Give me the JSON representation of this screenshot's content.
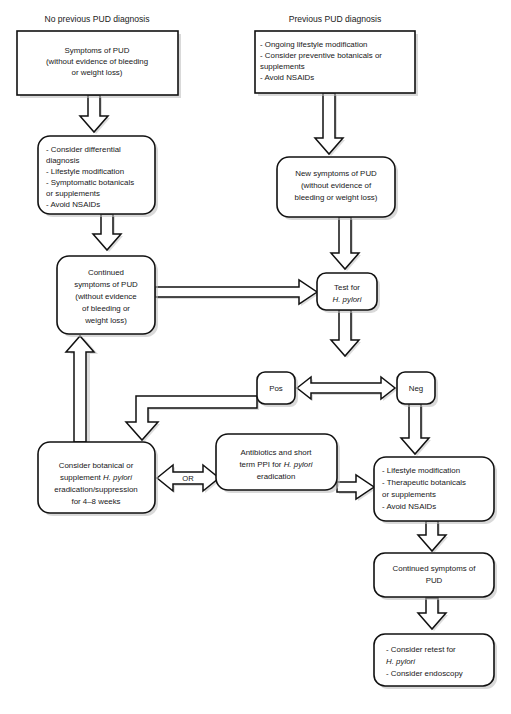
{
  "diagram": {
    "background_color": "#ffffff",
    "line_color": "#111111",
    "box_fill": "#ffffff",
    "text_color": "#181818",
    "columns": [
      {
        "id": "left-column",
        "label": "No previous PUD diagnosis"
      },
      {
        "id": "right-column",
        "label": "Previous PUD diagnosis"
      }
    ],
    "nodes": [
      {
        "id": "symptoms-of-pud",
        "shape": "rectangle",
        "align": "center",
        "lines": [
          "Symptoms of PUD",
          "(without evidence of bleeding",
          "or weight loss)"
        ]
      },
      {
        "id": "ongoing-lifestyle",
        "shape": "rectangle",
        "align": "left",
        "lines": [
          "- Ongoing lifestyle modification",
          "- Consider preventive botanicals or",
          "   supplements",
          "- Avoid NSAIDs"
        ]
      },
      {
        "id": "consider-differential",
        "shape": "rounded",
        "align": "left",
        "lines": [
          "- Consider differential",
          "   diagnosis",
          "- Lifestyle modification",
          "- Symptomatic botanicals",
          "   or supplements",
          "- Avoid NSAIDs"
        ]
      },
      {
        "id": "new-symptoms-of-pud",
        "shape": "rounded",
        "align": "center",
        "lines": [
          "New symptoms of PUD",
          "(without evidence of",
          "bleeding or weight loss)"
        ]
      },
      {
        "id": "continued-symptoms-of-pud",
        "shape": "rounded",
        "align": "center",
        "lines": [
          "Continued",
          "symptoms of PUD",
          "(without evidence",
          "of bleeding or",
          "weight loss)"
        ]
      },
      {
        "id": "test-for-h-pylori",
        "shape": "rounded",
        "align": "center",
        "lines": [
          "Test for",
          "H. pylori"
        ],
        "italic_lines": [
          1
        ]
      },
      {
        "id": "pos",
        "shape": "rounded",
        "align": "center",
        "lines": [
          "Pos"
        ]
      },
      {
        "id": "neg",
        "shape": "rounded",
        "align": "center",
        "lines": [
          "Neg"
        ]
      },
      {
        "id": "consider-botanical",
        "shape": "rounded",
        "align": "center",
        "lines": [
          "Consider botanical or",
          "supplement H. pylori",
          "eradication/suppression",
          "for 4–8 weeks"
        ]
      },
      {
        "id": "antibiotics-ppi",
        "shape": "rounded",
        "align": "center",
        "lines": [
          "Antibiotics and short",
          "term PPI for H. pylori",
          "eradication"
        ]
      },
      {
        "id": "lifestyle-therapeutic",
        "shape": "rounded",
        "align": "left",
        "lines": [
          "- Lifestyle modification",
          "- Therapeutic botanicals",
          "   or supplements",
          "- Avoid NSAIDs"
        ]
      },
      {
        "id": "continued-symptoms-pud-bottom",
        "shape": "rounded",
        "align": "center",
        "lines": [
          "Continued symptoms of",
          "PUD"
        ]
      },
      {
        "id": "consider-retest",
        "shape": "rounded",
        "align": "left",
        "lines": [
          "- Consider retest for",
          "   H. pylori",
          "- Consider endoscopy"
        ]
      }
    ],
    "connector_labels": [
      {
        "id": "or-label",
        "text": "OR"
      }
    ],
    "edges": [
      {
        "from": "symptoms-of-pud",
        "to": "consider-differential",
        "direction": "down"
      },
      {
        "from": "consider-differential",
        "to": "continued-symptoms-of-pud",
        "direction": "down"
      },
      {
        "from": "ongoing-lifestyle",
        "to": "new-symptoms-of-pud",
        "direction": "down"
      },
      {
        "from": "new-symptoms-of-pud",
        "to": "test-for-h-pylori",
        "direction": "down"
      },
      {
        "from": "continued-symptoms-of-pud",
        "to": "test-for-h-pylori",
        "direction": "right"
      },
      {
        "from": "test-for-h-pylori",
        "to": "pos-neg",
        "direction": "down"
      },
      {
        "from": "pos",
        "to": "neg",
        "direction": "bidirectional"
      },
      {
        "from": "pos",
        "to": "or-junction",
        "direction": "down"
      },
      {
        "from": "consider-botanical",
        "to": "antibiotics-ppi",
        "direction": "bidirectional"
      },
      {
        "from": "consider-botanical",
        "to": "continued-symptoms-of-pud",
        "direction": "up"
      },
      {
        "from": "antibiotics-ppi",
        "to": "lifestyle-therapeutic",
        "direction": "right"
      },
      {
        "from": "neg",
        "to": "lifestyle-therapeutic",
        "direction": "down"
      },
      {
        "from": "lifestyle-therapeutic",
        "to": "continued-symptoms-pud-bottom",
        "direction": "down"
      },
      {
        "from": "continued-symptoms-pud-bottom",
        "to": "consider-retest",
        "direction": "down"
      }
    ]
  }
}
